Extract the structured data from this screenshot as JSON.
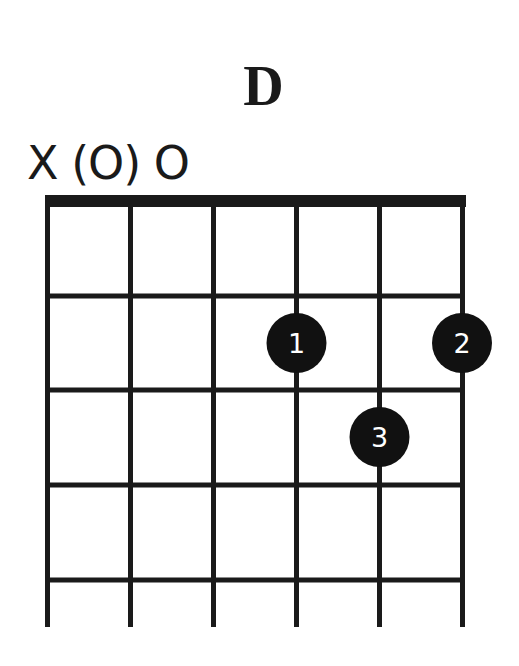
{
  "chord": {
    "name": "D",
    "string_markers": "X (O) O",
    "strings": 6,
    "frets_shown": 4,
    "start_fret": 1,
    "muted_strings": [
      6
    ],
    "open_strings": [
      4
    ],
    "optional_open_strings": [
      5
    ],
    "fingers": [
      {
        "finger": "1",
        "string": 3,
        "fret": 2
      },
      {
        "finger": "2",
        "string": 1,
        "fret": 2
      },
      {
        "finger": "3",
        "string": 2,
        "fret": 3
      }
    ]
  },
  "colors": {
    "line": "#1a1a1a",
    "dot": "#111111",
    "dot_text": "#ffffff",
    "background": "#ffffff"
  }
}
